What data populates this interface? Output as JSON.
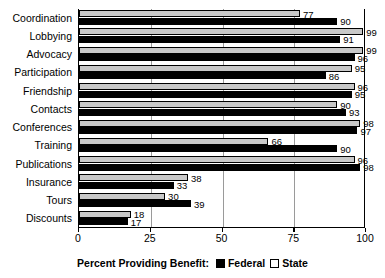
{
  "chart_data": {
    "type": "bar",
    "orientation": "horizontal",
    "title": "",
    "xlabel": "Percent Providing Benefit:",
    "ylabel": "",
    "xlim": [
      0,
      100
    ],
    "xticks": [
      0,
      25,
      50,
      75,
      100
    ],
    "xtick_labels": [
      "0",
      "25",
      "50",
      "75",
      "100"
    ],
    "grid": true,
    "grid_axis": "x",
    "legend_position": "bottom-center",
    "categories": [
      "Coordination",
      "Lobbying",
      "Advocacy",
      "Participation",
      "Friendship",
      "Contacts",
      "Conferences",
      "Training",
      "Publications",
      "Insurance",
      "Tours",
      "Discounts"
    ],
    "series": [
      {
        "name": "State",
        "color": "#c8c8c8",
        "values": [
          77,
          99,
          99,
          95,
          96,
          90,
          98,
          66,
          96,
          38,
          30,
          18
        ]
      },
      {
        "name": "Federal",
        "color": "#000000",
        "values": [
          90,
          91,
          96,
          86,
          95,
          93,
          97,
          90,
          98,
          33,
          39,
          17
        ]
      }
    ]
  },
  "legend": {
    "prefix": "Percent Providing Benefit:",
    "entries": [
      {
        "label": "Federal",
        "swatch": "filled-black-square"
      },
      {
        "label": "State",
        "swatch": "outlined-white-square"
      }
    ]
  }
}
